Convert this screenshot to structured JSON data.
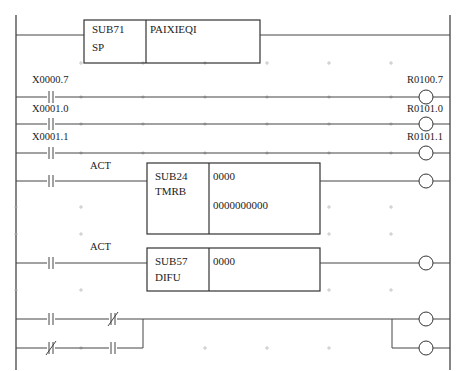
{
  "diagram": {
    "type": "ladder-diagram",
    "rungs": [
      {
        "id": 1,
        "function_block": {
          "code": "SUB71",
          "name": "SP",
          "param": "PAIXIEQI"
        }
      },
      {
        "id": 2,
        "contact": {
          "address": "X0000.7",
          "type": "NO"
        },
        "coil": {
          "address": "R0100.7"
        }
      },
      {
        "id": 3,
        "contact": {
          "address": "X0001.0",
          "type": "NO"
        },
        "coil": {
          "address": "R0101.0"
        }
      },
      {
        "id": 4,
        "contact": {
          "address": "X0001.1",
          "type": "NO"
        },
        "coil": {
          "address": "R0101.1"
        }
      },
      {
        "id": 5,
        "contact": {
          "type": "NO"
        },
        "act_label": "ACT",
        "function_block": {
          "code": "SUB24",
          "name": "TMRB",
          "param1": "0000",
          "param2": "0000000000"
        },
        "coil": {}
      },
      {
        "id": 6,
        "contact": {
          "type": "NO"
        },
        "act_label": "ACT",
        "function_block": {
          "code": "SUB57",
          "name": "DIFU",
          "param1": "0000"
        },
        "coil": {}
      },
      {
        "id": 7,
        "contacts": [
          {
            "type": "NO"
          },
          {
            "type": "NC"
          }
        ],
        "parallel_branch": [
          {
            "type": "NC"
          },
          {
            "type": "NO"
          }
        ],
        "coils": [
          {},
          {}
        ]
      }
    ]
  }
}
